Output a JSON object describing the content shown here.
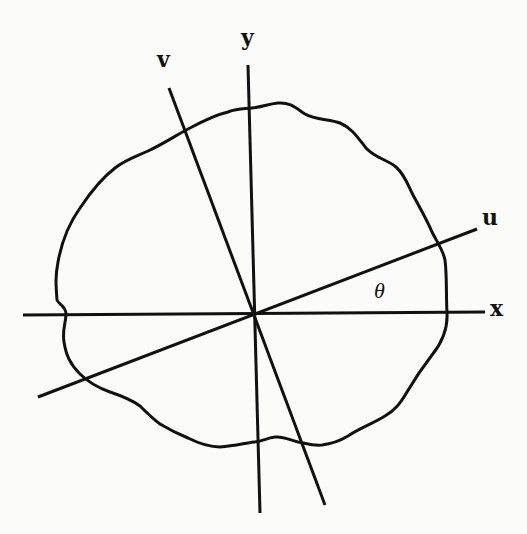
{
  "figure": {
    "axes": {
      "x": {
        "label": "x"
      },
      "y": {
        "label": "y"
      },
      "u": {
        "label": "u"
      },
      "v": {
        "label": "v"
      }
    },
    "angle": {
      "label": "θ"
    },
    "curve": {
      "description": "closed irregular wavy boundary around origin"
    },
    "colors": {
      "ink": "#111111",
      "paper": "#fbfbfa"
    }
  }
}
